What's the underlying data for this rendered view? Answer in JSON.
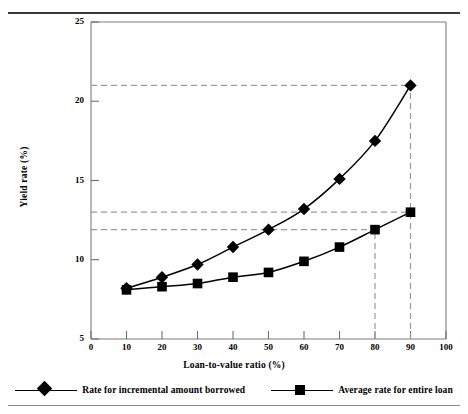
{
  "chart_data": {
    "type": "line",
    "title": "",
    "subtitle": "",
    "xlabel": "Loan-to-value ratio (%)",
    "ylabel": "Yield rate (%)",
    "x": [
      10,
      20,
      30,
      40,
      50,
      60,
      70,
      80,
      90
    ],
    "xlim": [
      0,
      100
    ],
    "ylim": [
      5,
      25
    ],
    "xticks": [
      "0",
      "10",
      "20",
      "30",
      "40",
      "50",
      "60",
      "70",
      "80",
      "90",
      "100"
    ],
    "xtick_values": [
      0,
      10,
      20,
      30,
      40,
      50,
      60,
      70,
      80,
      90,
      100
    ],
    "yticks": [
      "5",
      "10",
      "15",
      "20",
      "25"
    ],
    "ytick_values": [
      5,
      10,
      15,
      20,
      25
    ],
    "grid": false,
    "legend_position": "below-plot",
    "series": [
      {
        "name": "Rate for incremental amount borrowed",
        "marker": "diamond",
        "color": "#000000",
        "values": [
          8.2,
          8.9,
          9.7,
          10.8,
          11.9,
          13.2,
          15.1,
          17.5,
          21.0
        ]
      },
      {
        "name": "Average rate for entire loan",
        "marker": "square",
        "color": "#000000",
        "values": [
          8.1,
          8.3,
          8.5,
          8.9,
          9.2,
          9.9,
          10.8,
          11.9,
          13.0
        ]
      }
    ],
    "annotations": {
      "guide_color": "#9a9a9a",
      "horizontal_guides": [
        {
          "y": 21.0,
          "from_x": 0,
          "to_x": 90,
          "label": ""
        },
        {
          "y": 13.0,
          "from_x": 0,
          "to_x": 90,
          "label": ""
        },
        {
          "y": 11.9,
          "from_x": 0,
          "to_x": 80,
          "label": ""
        }
      ],
      "vertical_guides": [
        {
          "x": 80,
          "from_y": 5,
          "to_y": 11.9,
          "label": ""
        },
        {
          "x": 90,
          "from_y": 5,
          "to_y": 21.0,
          "label": ""
        }
      ]
    }
  },
  "legend": {
    "entries": [
      {
        "label": "Rate for incremental amount borrowed",
        "marker": "diamond"
      },
      {
        "label": "Average rate for entire loan",
        "marker": "square"
      }
    ]
  }
}
